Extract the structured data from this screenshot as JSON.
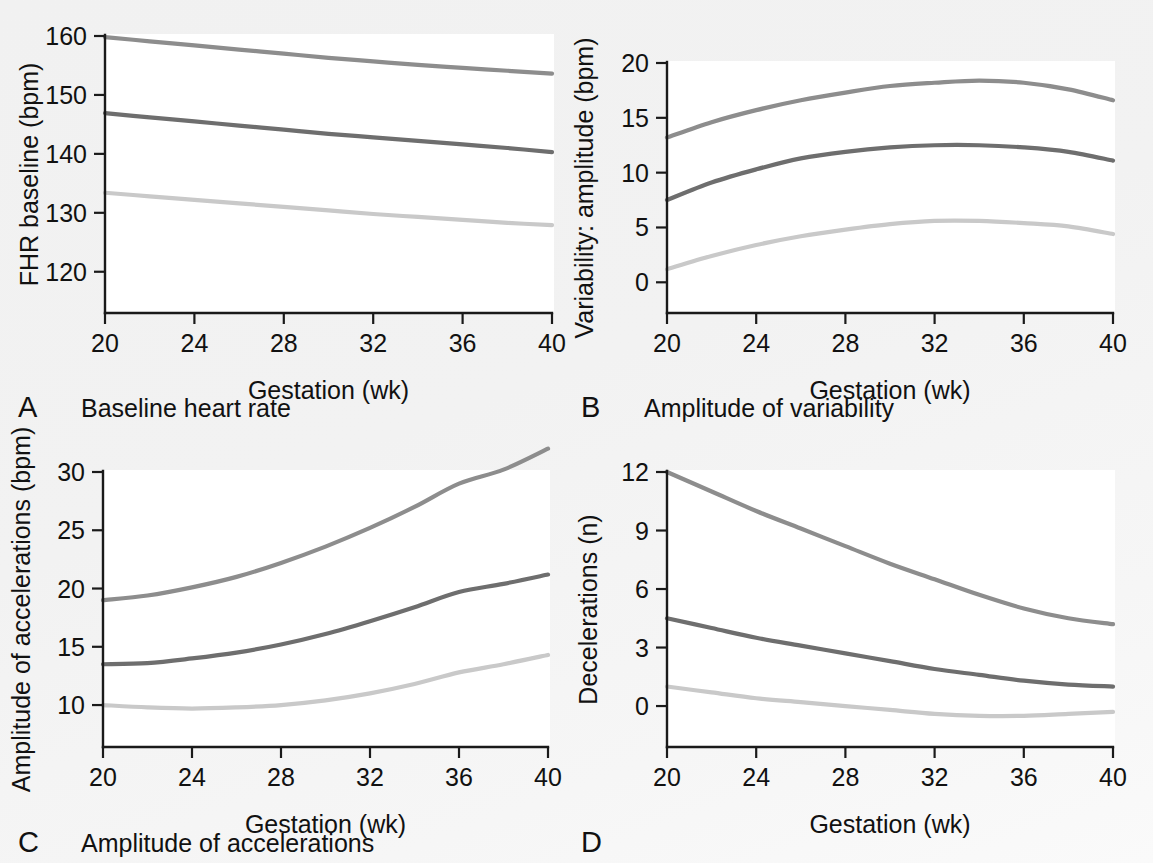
{
  "figure": {
    "background_color": "#f3f3f3",
    "plot_background_color": "#ffffff",
    "axis_color": "#1a1a1a"
  },
  "series_colors": {
    "upper": "#8d8d8d",
    "median": "#6e6e6e",
    "lower": "#c9c9c9"
  },
  "panels": [
    {
      "letter": "A",
      "caption": "Baseline heart rate",
      "chart_data": {
        "type": "line",
        "title": "Baseline heart rate",
        "xlabel": "Gestation (wk)",
        "ylabel": "FHR baseline (bpm)",
        "xlim": [
          20,
          40
        ],
        "ylim": [
          113,
          160
        ],
        "xticks": [
          20,
          24,
          28,
          32,
          36,
          40
        ],
        "yticks": [
          120,
          130,
          140,
          150,
          160
        ],
        "grid": false,
        "legend": "none",
        "x": [
          20,
          22,
          24,
          26,
          28,
          30,
          32,
          34,
          36,
          38,
          40
        ],
        "series": [
          {
            "name": "upper centile",
            "color_key": "upper",
            "values": [
              159.8,
              159.1,
              158.4,
              157.7,
              157.0,
              156.3,
              155.7,
              155.1,
              154.6,
              154.1,
              153.6
            ]
          },
          {
            "name": "median",
            "color_key": "median",
            "values": [
              146.9,
              146.2,
              145.5,
              144.8,
              144.1,
              143.4,
              142.8,
              142.2,
              141.6,
              141.0,
              140.3
            ]
          },
          {
            "name": "lower centile",
            "color_key": "lower",
            "values": [
              133.4,
              132.8,
              132.2,
              131.6,
              131.0,
              130.4,
              129.8,
              129.3,
              128.8,
              128.3,
              127.9
            ]
          }
        ]
      }
    },
    {
      "letter": "B",
      "caption": "Amplitude of variability",
      "chart_data": {
        "type": "line",
        "title": "Amplitude of variability",
        "xlabel": "Gestation (wk)",
        "ylabel": "Variability: amplitude (bpm)",
        "xlim": [
          20,
          40
        ],
        "ylim": [
          -2.8,
          20
        ],
        "xticks": [
          20,
          24,
          28,
          32,
          36,
          40
        ],
        "yticks": [
          0,
          5,
          10,
          15,
          20
        ],
        "grid": false,
        "legend": "none",
        "x": [
          20,
          22,
          24,
          26,
          28,
          30,
          32,
          34,
          36,
          38,
          40
        ],
        "series": [
          {
            "name": "upper centile",
            "color_key": "upper",
            "values": [
              13.2,
              14.6,
              15.7,
              16.6,
              17.3,
              17.9,
              18.2,
              18.4,
              18.2,
              17.6,
              16.6
            ]
          },
          {
            "name": "median",
            "color_key": "median",
            "values": [
              7.5,
              9.1,
              10.3,
              11.3,
              11.9,
              12.3,
              12.5,
              12.5,
              12.3,
              11.9,
              11.1
            ]
          },
          {
            "name": "lower centile",
            "color_key": "lower",
            "values": [
              1.2,
              2.4,
              3.4,
              4.2,
              4.8,
              5.3,
              5.6,
              5.6,
              5.4,
              5.1,
              4.4
            ]
          }
        ]
      }
    },
    {
      "letter": "C",
      "caption": "Amplitude of accelerations",
      "chart_data": {
        "type": "line",
        "title": "Amplitude of accelerations",
        "xlabel": "Gestation (wk)",
        "ylabel": "Amplitude of accelerations (bpm)",
        "xlim": [
          20,
          40
        ],
        "ylim": [
          6.4,
          30
        ],
        "xticks": [
          20,
          24,
          28,
          32,
          36,
          40
        ],
        "yticks": [
          10,
          15,
          20,
          25,
          30
        ],
        "grid": false,
        "legend": "none",
        "x": [
          20,
          22,
          24,
          26,
          28,
          30,
          32,
          34,
          36,
          38,
          40
        ],
        "series": [
          {
            "name": "upper centile",
            "color_key": "upper",
            "values": [
              19.0,
              19.4,
              20.1,
              21.0,
              22.2,
              23.6,
              25.2,
              27.0,
              29.0,
              30.2,
              32.0
            ]
          },
          {
            "name": "median",
            "color_key": "median",
            "values": [
              13.5,
              13.6,
              14.0,
              14.5,
              15.2,
              16.1,
              17.2,
              18.4,
              19.7,
              20.4,
              21.2
            ]
          },
          {
            "name": "lower centile",
            "color_key": "lower",
            "values": [
              10.0,
              9.8,
              9.7,
              9.8,
              10.0,
              10.4,
              11.0,
              11.8,
              12.8,
              13.5,
              14.3
            ]
          }
        ]
      }
    },
    {
      "letter": "D",
      "caption": "",
      "chart_data": {
        "type": "line",
        "title": "Decelerations",
        "xlabel": "Gestation  (wk)",
        "ylabel": "Decelerations (n)",
        "xlim": [
          20,
          40
        ],
        "ylim": [
          -2.1,
          12
        ],
        "xticks": [
          20,
          24,
          28,
          32,
          36,
          40
        ],
        "yticks": [
          0,
          3,
          6,
          9,
          12
        ],
        "grid": false,
        "legend": "none",
        "x": [
          20,
          22,
          24,
          26,
          28,
          30,
          32,
          34,
          36,
          38,
          40
        ],
        "series": [
          {
            "name": "upper centile",
            "color_key": "upper",
            "values": [
              12.0,
              11.0,
              10.0,
              9.1,
              8.2,
              7.3,
              6.5,
              5.7,
              5.0,
              4.5,
              4.2
            ]
          },
          {
            "name": "median",
            "color_key": "median",
            "values": [
              4.5,
              4.0,
              3.5,
              3.1,
              2.7,
              2.3,
              1.9,
              1.6,
              1.3,
              1.1,
              1.0
            ]
          },
          {
            "name": "lower centile",
            "color_key": "lower",
            "values": [
              1.0,
              0.7,
              0.4,
              0.2,
              0.0,
              -0.2,
              -0.4,
              -0.5,
              -0.5,
              -0.4,
              -0.3
            ]
          }
        ]
      }
    }
  ]
}
